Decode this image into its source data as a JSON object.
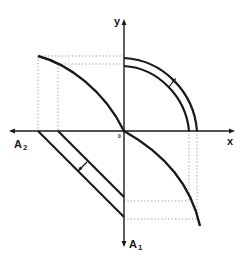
{
  "diagram": {
    "colors": {
      "stroke": "#1a1a1a",
      "dotted": "#8a8a8a",
      "background": "#ffffff"
    },
    "axes": {
      "y_label": "y",
      "x_label": "x",
      "neg_x_label": "A",
      "neg_x_sub": "2",
      "neg_y_label": "A",
      "neg_y_sub": "1",
      "origin_label": "0"
    },
    "quadrants": {
      "q1": "two concentric arcs with outward shift arrow",
      "q2": "concave curve from y-axis to A2 side",
      "q3": "two parallel 45-degree lines with shift arrow",
      "q4": "concave curve from origin toward A1 side"
    },
    "guides": {
      "vertical_dotted": [
        "left curve start",
        "left curve second point",
        "q1 inner arc x-intercept",
        "q1 outer arc x-intercept"
      ],
      "horizontal_dotted": [
        "q1 outer arc y-intercept",
        "q1 inner arc y-intercept",
        "q3 inner line A1-intercept",
        "q3 outer line A1-intercept"
      ]
    }
  }
}
